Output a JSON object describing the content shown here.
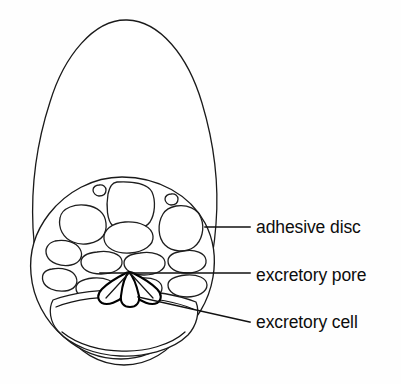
{
  "figure": {
    "name": "adhesive-disc-anatomy",
    "background_color": "#fefefe",
    "ink_color": "#151515",
    "width": 401,
    "height": 384
  },
  "labels": [
    {
      "id": "adhesive-disc",
      "text": "adhesive disc",
      "text_x": 256,
      "text_y": 228,
      "leader_type": "horizontal",
      "leader_points": "205,227 250,227"
    },
    {
      "id": "excretory-pore",
      "text": "excretory pore",
      "text_x": 256,
      "text_y": 276,
      "leader_type": "horizontal",
      "leader_points": "100,273 250,273"
    },
    {
      "id": "excretory-cell",
      "text": "excretory cell",
      "text_x": 256,
      "text_y": 323,
      "leader_type": "diagonal",
      "leader_points": "138,297 250,322"
    }
  ],
  "structures": {
    "body": {
      "name": "body-outline",
      "description": "teardrop shaped organism body",
      "apex_x": 127,
      "apex_y": 20
    },
    "disc": {
      "name": "adhesive-disc",
      "center_x": 122,
      "center_y": 272,
      "radius_x": 92,
      "radius_y": 95
    },
    "cavity": {
      "name": "basal-cavity",
      "description": "large basin cavity at base of disc"
    },
    "excretory_cell": {
      "name": "excretory-cell",
      "description": "dark butterfly shaped cell below the pore"
    },
    "vacuole_count": 16
  }
}
